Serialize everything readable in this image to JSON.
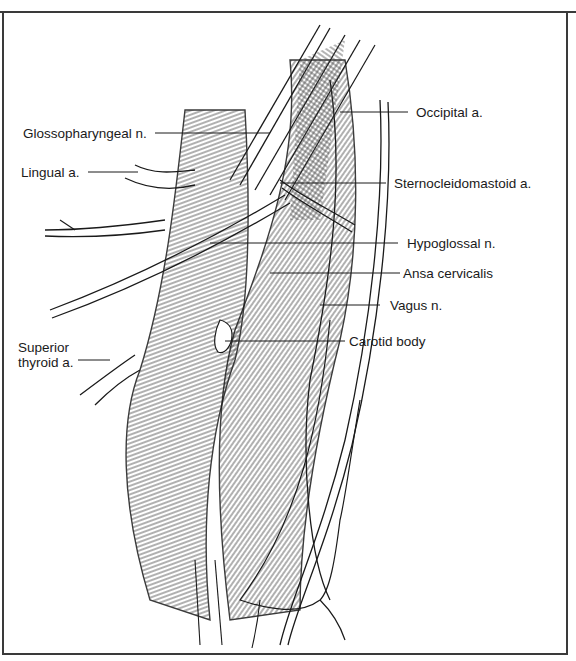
{
  "figure": {
    "type": "anatomical line drawing"
  },
  "labels": [
    {
      "id": "occipital",
      "text": "Occipital a.",
      "side": "right"
    },
    {
      "id": "glossopharyngeal",
      "text": "Glossopharyngeal n.",
      "side": "left"
    },
    {
      "id": "lingual",
      "text": "Lingual a.",
      "side": "left"
    },
    {
      "id": "sternocleidomastoid",
      "text": "Sternocleidomastoid a.",
      "side": "right"
    },
    {
      "id": "hypoglossal",
      "text": "Hypoglossal n.",
      "side": "right"
    },
    {
      "id": "ansa",
      "text": "Ansa cervicalis",
      "side": "right"
    },
    {
      "id": "vagus",
      "text": "Vagus n.",
      "side": "right"
    },
    {
      "id": "carotid_body",
      "text": "Carotid body",
      "side": "right"
    },
    {
      "id": "superior_thyroid",
      "text": "Superior\nthyroid a.",
      "side": "left"
    }
  ],
  "colors": {
    "ink": "#1a1a1a",
    "frame": "#3a3a3a",
    "background": "#ffffff"
  }
}
